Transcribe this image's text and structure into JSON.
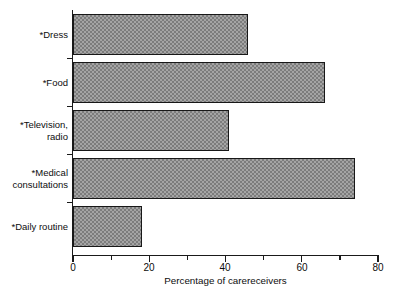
{
  "chart_data": {
    "type": "bar",
    "orientation": "horizontal",
    "title": "",
    "categories": [
      "*Dress",
      "*Food",
      "*Television,\nradio",
      "*Medical\nconsultations",
      "*Daily routine"
    ],
    "values": [
      46,
      66,
      41,
      74,
      18
    ],
    "xlabel": "Percentage of carereceivers",
    "ylabel": "",
    "xlim": [
      0,
      80
    ],
    "xticks": [
      0,
      20,
      40,
      60,
      80
    ],
    "xtick_labels": [
      "0",
      "20",
      "40",
      "60",
      "80"
    ],
    "xminor_ticks": [
      10,
      30,
      50,
      70
    ],
    "grid": false,
    "legend": null,
    "bar_fill_color": "#7c7c7c",
    "bar_edge_color": "#181818",
    "axis_color": "#1a1a1a",
    "background_color": "#ffffff"
  },
  "axis": {
    "x_label": "Percentage of carereceivers",
    "tick_0": "0",
    "tick_20": "20",
    "tick_40": "40",
    "tick_60": "60",
    "tick_80": "80"
  },
  "categories": {
    "c0": "*Dress",
    "c1": "*Food",
    "c2": "*Television,\nradio",
    "c3": "*Medical\nconsultations",
    "c4": "*Daily routine"
  }
}
